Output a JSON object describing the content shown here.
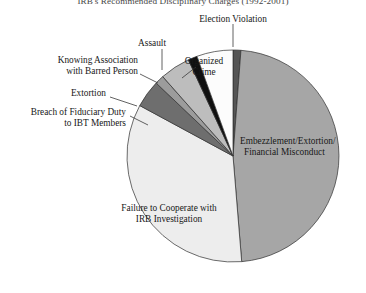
{
  "chart_data": {
    "type": "pie",
    "title": "IRB's Recommended Disciplinary Charges (1992-2001)",
    "xlabel": "",
    "ylabel": "",
    "legend_position": "none",
    "grid": false,
    "categories": [
      "Election Violation",
      "Embezzlement/Extortion/ Financial Misconduct",
      "Failure to Cooperate with IRB Investigation",
      "Breach of Fiduciary Duty to IBT Members",
      "Extortion",
      "Knowing Association with Barred Person",
      "Assault",
      "Organized Crime"
    ],
    "values": [
      1.2,
      47.5,
      34.2,
      4.2,
      1.4,
      4.6,
      1.4,
      5.5
    ],
    "slices": [
      {
        "label": "Election Violation",
        "value": 1.2,
        "start_deg": 0.0,
        "end_deg": 4.3,
        "color": "#555555"
      },
      {
        "label": "Embezzlement/Extortion/",
        "value": 47.5,
        "start_deg": 4.3,
        "end_deg": 175.3,
        "color": "#a6a6a6"
      },
      {
        "label": "Failure to Cooperate with",
        "value": 34.2,
        "start_deg": 175.3,
        "end_deg": 298.4,
        "color": "#ededed"
      },
      {
        "label": "Breach of Fiduciary Duty",
        "value": 4.2,
        "start_deg": 298.4,
        "end_deg": 313.5,
        "color": "#6e6e6e"
      },
      {
        "label": "Extortion",
        "value": 1.4,
        "start_deg": 313.5,
        "end_deg": 318.5,
        "color": "#9c9c9c"
      },
      {
        "label": "Knowing Association",
        "value": 4.6,
        "start_deg": 318.5,
        "end_deg": 335.1,
        "color": "#bdbdbd"
      },
      {
        "label": "Assault",
        "value": 1.4,
        "start_deg": 335.1,
        "end_deg": 340.1,
        "color": "#101010"
      },
      {
        "label": "Organized Crime",
        "value": 5.5,
        "start_deg": 340.1,
        "end_deg": 360.0,
        "color": "#fcfcfc"
      }
    ]
  },
  "labels": {
    "title": "IRB's Recommended Disciplinary Charges (1992-2001)",
    "election_violation": "Election Violation",
    "organized_crime_l1": "Organized",
    "organized_crime_l2": "Crime",
    "assault": "Assault",
    "knowing_association_l1": "Knowing Association",
    "knowing_association_l2": "with Barred Person",
    "extortion": "Extortion",
    "breach_l1": "Breach of Fiduciary Duty",
    "breach_l2": "to IBT Members",
    "embezzlement_l1": "Embezzlement/Extortion/",
    "embezzlement_l2": "Financial Misconduct",
    "failure_l1": "Failure to Cooperate with",
    "failure_l2": "IRB Investigation"
  },
  "colors": {
    "outline": "#2f2f2f",
    "text": "#181818",
    "background": "#ffffff"
  }
}
